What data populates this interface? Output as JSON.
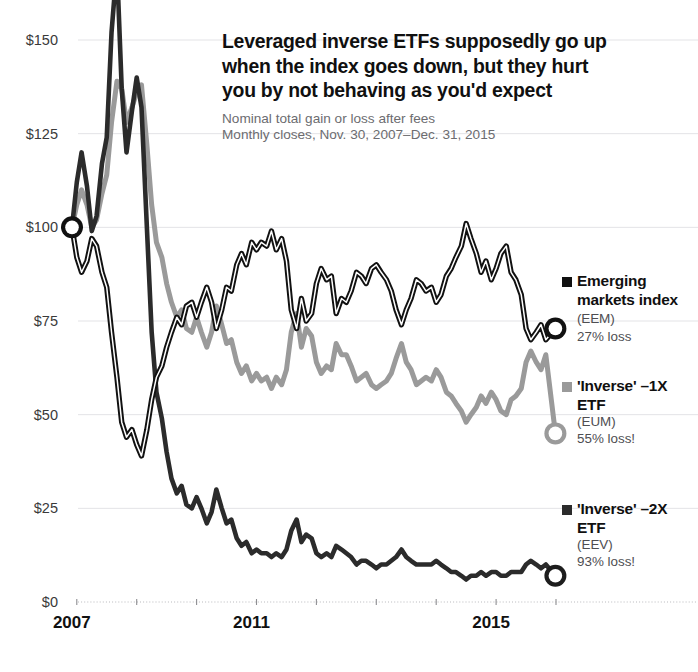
{
  "header": {
    "title": "Leveraged inverse ETFs supposedly go up when the index goes down, but they hurt you by not behaving as you'd expect",
    "subtitle_line1": "Nominal total gain or loss after fees",
    "subtitle_line2": "Monthly closes, Nov. 30, 2007–Dec. 31, 2015"
  },
  "legend": {
    "items": [
      {
        "name": "Emerging markets index",
        "ticker": "(EEM)",
        "note": "27% loss",
        "color": "#111111",
        "swatch": "legend-swatch-eem"
      },
      {
        "name": "'Inverse' –1X ETF",
        "ticker": "(EUM)",
        "note": "55% loss!",
        "color": "#9a9a9a",
        "swatch": "legend-swatch-eum"
      },
      {
        "name": "'Inverse' –2X ETF",
        "ticker": "(EEV)",
        "note": "93% loss!",
        "color": "#2b2b2b",
        "swatch": "legend-swatch-eev"
      }
    ]
  },
  "chart_data": {
    "type": "line",
    "title": "Leveraged inverse ETFs supposedly go up when the index goes down, but they hurt you by not behaving as you'd expect",
    "subtitle": "Nominal total gain or loss after fees. Monthly closes, Nov. 30, 2007–Dec. 31, 2015",
    "xlabel": "",
    "ylabel": "",
    "xlim": [
      2007.92,
      2016.0
    ],
    "ylim": [
      0,
      150
    ],
    "ytick_values": [
      0,
      25,
      50,
      75,
      100,
      125,
      150
    ],
    "ytick_labels": [
      "$0",
      "$25",
      "$50",
      "$75",
      "$100",
      "$125",
      "$150"
    ],
    "xtick_values": [
      2007,
      2011,
      2015
    ],
    "xtick_labels": [
      "2007",
      "2011",
      "2015"
    ],
    "grid": true,
    "legend_position": "right",
    "start_value": 100,
    "annotations": [
      {
        "label": "start marker",
        "x": 2007.92,
        "y": 100
      },
      {
        "label": "EEM end marker",
        "x": 2015.99,
        "y": 73
      },
      {
        "label": "EUM end marker",
        "x": 2015.99,
        "y": 45
      },
      {
        "label": "EEV end marker",
        "x": 2015.99,
        "y": 7
      }
    ],
    "x": [
      2007.92,
      2008.0,
      2008.08,
      2008.17,
      2008.25,
      2008.33,
      2008.42,
      2008.5,
      2008.58,
      2008.67,
      2008.75,
      2008.83,
      2008.92,
      2009.0,
      2009.08,
      2009.17,
      2009.25,
      2009.33,
      2009.42,
      2009.5,
      2009.58,
      2009.67,
      2009.75,
      2009.83,
      2009.92,
      2010.0,
      2010.08,
      2010.17,
      2010.25,
      2010.33,
      2010.42,
      2010.5,
      2010.58,
      2010.67,
      2010.75,
      2010.83,
      2010.92,
      2011.0,
      2011.08,
      2011.17,
      2011.25,
      2011.33,
      2011.42,
      2011.5,
      2011.58,
      2011.67,
      2011.75,
      2011.83,
      2011.92,
      2012.0,
      2012.08,
      2012.17,
      2012.25,
      2012.33,
      2012.42,
      2012.5,
      2012.58,
      2012.67,
      2012.75,
      2012.83,
      2012.92,
      2013.0,
      2013.08,
      2013.17,
      2013.25,
      2013.33,
      2013.42,
      2013.5,
      2013.58,
      2013.67,
      2013.75,
      2013.83,
      2013.92,
      2014.0,
      2014.08,
      2014.17,
      2014.25,
      2014.33,
      2014.42,
      2014.5,
      2014.58,
      2014.67,
      2014.75,
      2014.83,
      2014.92,
      2015.0,
      2015.08,
      2015.17,
      2015.25,
      2015.33,
      2015.42,
      2015.5,
      2015.58,
      2015.67,
      2015.75,
      2015.83,
      2015.99
    ],
    "series": [
      {
        "name": "Emerging markets index (EEM)",
        "key": "eem",
        "color": "#111111",
        "final_value": 73,
        "pct_change": -27,
        "values": [
          100,
          92,
          88,
          91,
          97,
          95,
          88,
          84,
          72,
          60,
          48,
          44,
          46,
          42,
          39,
          46,
          54,
          60,
          63,
          68,
          72,
          76,
          74,
          79,
          80,
          76,
          80,
          84,
          80,
          73,
          78,
          84,
          83,
          90,
          93,
          90,
          96,
          94,
          96,
          95,
          99,
          94,
          97,
          91,
          78,
          73,
          81,
          75,
          77,
          85,
          89,
          86,
          87,
          77,
          81,
          80,
          83,
          88,
          87,
          85,
          89,
          90,
          88,
          86,
          83,
          78,
          74,
          78,
          81,
          86,
          85,
          83,
          84,
          80,
          82,
          87,
          89,
          92,
          95,
          101,
          97,
          93,
          88,
          91,
          86,
          89,
          93,
          95,
          88,
          86,
          82,
          73,
          70,
          72,
          74,
          70,
          73
        ]
      },
      {
        "name": "'Inverse' –1X ETF (EUM)",
        "key": "eum",
        "color": "#9a9a9a",
        "final_value": 45,
        "pct_change": -55,
        "values": [
          100,
          106,
          110,
          106,
          100,
          102,
          109,
          114,
          128,
          139,
          137,
          128,
          132,
          136,
          138,
          122,
          106,
          96,
          92,
          85,
          80,
          76,
          78,
          73,
          72,
          76,
          72,
          68,
          72,
          79,
          74,
          69,
          70,
          64,
          61,
          63,
          59,
          61,
          59,
          60,
          57,
          60,
          58,
          62,
          72,
          77,
          68,
          73,
          71,
          64,
          61,
          63,
          62,
          69,
          66,
          66,
          63,
          59,
          60,
          61,
          58,
          57,
          58,
          59,
          61,
          65,
          69,
          64,
          62,
          58,
          59,
          60,
          59,
          62,
          60,
          56,
          55,
          53,
          51,
          48,
          50,
          52,
          55,
          53,
          56,
          54,
          51,
          50,
          54,
          55,
          57,
          64,
          67,
          64,
          62,
          66,
          45
        ]
      },
      {
        "name": "'Inverse' –2X ETF (EEV)",
        "key": "eev",
        "color": "#2b2b2b",
        "final_value": 7,
        "pct_change": -93,
        "values": [
          100,
          112,
          120,
          111,
          99,
          103,
          117,
          124,
          152,
          178,
          137,
          120,
          131,
          140,
          132,
          100,
          72,
          56,
          49,
          40,
          33,
          29,
          31,
          26,
          25,
          28,
          25,
          21,
          24,
          30,
          25,
          21,
          22,
          17,
          15,
          16,
          13,
          14,
          13,
          13,
          12,
          13,
          12,
          14,
          19,
          22,
          16,
          18,
          17,
          13,
          12,
          13,
          12,
          15,
          14,
          13,
          12,
          10,
          11,
          11,
          10,
          9,
          10,
          10,
          11,
          12,
          14,
          12,
          11,
          10,
          10,
          10,
          10,
          11,
          10,
          9,
          8,
          8,
          7,
          6,
          7,
          7,
          8,
          7,
          8,
          8,
          7,
          7,
          8,
          8,
          8,
          10,
          11,
          10,
          9,
          10,
          7
        ]
      }
    ]
  }
}
